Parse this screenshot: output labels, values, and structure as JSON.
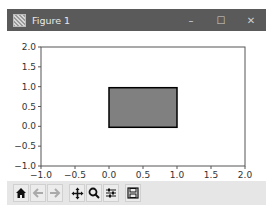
{
  "window": {
    "title": "Figure 1",
    "controls": {
      "minimize": "–",
      "maximize": "☐",
      "close": "✕"
    }
  },
  "chart_data": {
    "type": "patch",
    "title": "",
    "xlabel": "",
    "ylabel": "",
    "xlim": [
      -1.0,
      2.0
    ],
    "ylim": [
      -1.0,
      2.0
    ],
    "xticks": [
      "-1.0",
      "-0.5",
      "0.0",
      "0.5",
      "1.0",
      "1.5",
      "2.0"
    ],
    "yticks": [
      "-1.0",
      "-0.5",
      "0.0",
      "0.5",
      "1.0",
      "1.5",
      "2.0"
    ],
    "grid": false,
    "rectangle": {
      "x": 0.0,
      "y": 0.0,
      "width": 1.0,
      "height": 1.0,
      "facecolor": "#808080",
      "edgecolor": "#000000"
    }
  },
  "toolbar": {
    "buttons": [
      {
        "name": "home",
        "tooltip": "Reset original view"
      },
      {
        "name": "back",
        "tooltip": "Back to previous view"
      },
      {
        "name": "forward",
        "tooltip": "Forward to next view"
      },
      {
        "name": "pan",
        "tooltip": "Pan axes"
      },
      {
        "name": "zoom",
        "tooltip": "Zoom to rectangle"
      },
      {
        "name": "configure",
        "tooltip": "Configure subplots"
      },
      {
        "name": "save",
        "tooltip": "Save the figure"
      }
    ]
  }
}
